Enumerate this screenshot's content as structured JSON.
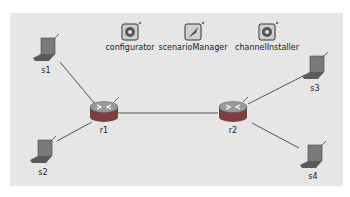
{
  "diagram": {
    "type": "network-topology",
    "modules": [
      {
        "id": "configurator",
        "label": "configurator",
        "icon": "gear-icon"
      },
      {
        "id": "scenarioManager",
        "label": "scenarioManager",
        "icon": "quill-icon"
      },
      {
        "id": "channelInstaller",
        "label": "channelInstaller",
        "icon": "gear-icon"
      }
    ],
    "nodes": [
      {
        "id": "s1",
        "label": "s1",
        "kind": "laptop"
      },
      {
        "id": "s2",
        "label": "s2",
        "kind": "laptop"
      },
      {
        "id": "r1",
        "label": "r1",
        "kind": "router"
      },
      {
        "id": "r2",
        "label": "r2",
        "kind": "router"
      },
      {
        "id": "s3",
        "label": "s3",
        "kind": "laptop"
      },
      {
        "id": "s4",
        "label": "s4",
        "kind": "laptop"
      }
    ],
    "links": [
      {
        "from": "s1",
        "to": "r1"
      },
      {
        "from": "s2",
        "to": "r1"
      },
      {
        "from": "r1",
        "to": "r2"
      },
      {
        "from": "r2",
        "to": "s3"
      },
      {
        "from": "r2",
        "to": "s4"
      }
    ],
    "colors": {
      "canvas": "#e6e6e6",
      "link": "#555555",
      "router_body": "#8a4a4a",
      "laptop_body": "#8c8c8c"
    }
  }
}
